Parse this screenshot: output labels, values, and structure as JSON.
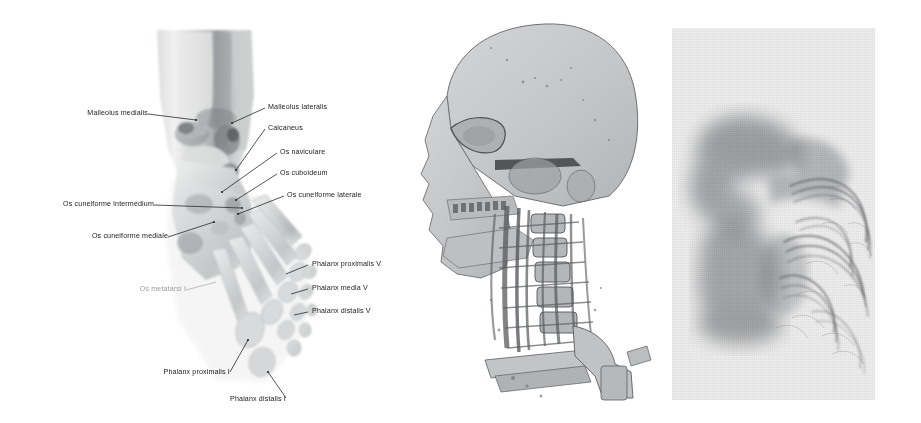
{
  "figure": {
    "caption_visible": false,
    "background_color": "#ffffff",
    "panel_count": 3
  },
  "panels": {
    "foot": {
      "name": "Annotated CT volume rendering of foot and ankle",
      "modality": "ct-volume-rendering",
      "view": "dorsal oblique",
      "render_color": "#b9bcbe",
      "label_color": "#1a1a1a",
      "faint_label_color": "#9a9a9a",
      "labels": [
        {
          "id": "malleolus-medialis",
          "text": "Malleolus medialis",
          "side": "left",
          "x": 58,
          "y": 116,
          "lead_to_x": 162,
          "lead_to_y": 122,
          "faint": false
        },
        {
          "id": "malleolus-lateralis",
          "text": "Malleolus lateralis",
          "side": "right",
          "x": 268,
          "y": 110,
          "lead_to_x": 233,
          "lead_to_y": 123,
          "faint": false
        },
        {
          "id": "calcaneus",
          "text": "Calcaneus",
          "side": "right",
          "x": 268,
          "y": 131,
          "lead_to_x": 238,
          "lead_to_y": 172,
          "faint": false
        },
        {
          "id": "os-naviculare",
          "text": "Os naviculare",
          "side": "right",
          "x": 280,
          "y": 155,
          "lead_to_x": 222,
          "lead_to_y": 192,
          "faint": false
        },
        {
          "id": "os-cuboideum",
          "text": "Os cuboideum",
          "side": "right",
          "x": 280,
          "y": 176,
          "lead_to_x": 235,
          "lead_to_y": 201,
          "faint": false
        },
        {
          "id": "os-cuneiforme-laterale",
          "text": "Os cuneiforme laterale",
          "side": "right",
          "x": 287,
          "y": 198,
          "lead_to_x": 237,
          "lead_to_y": 214,
          "faint": false
        },
        {
          "id": "os-cuneiforme-intermedium",
          "text": "Os cuneiforme intermedium",
          "side": "left",
          "x": 62,
          "y": 207,
          "lead_to_x": 235,
          "lead_to_y": 209,
          "faint": false
        },
        {
          "id": "os-cuneiforme-mediale",
          "text": "Os cuneiforme mediale",
          "side": "left",
          "x": 65,
          "y": 239,
          "lead_to_x": 213,
          "lead_to_y": 223,
          "faint": false
        },
        {
          "id": "os-metatarsi-i",
          "text": "Os metatarsi I",
          "side": "left",
          "x": 120,
          "y": 292,
          "lead_to_x": 208,
          "lead_to_y": 281,
          "faint": true
        },
        {
          "id": "phalanx-proximalis-v",
          "text": "Phalanx proximalis V",
          "side": "right",
          "x": 312,
          "y": 267,
          "lead_to_x": 291,
          "lead_to_y": 275,
          "faint": false
        },
        {
          "id": "phalanx-media-v",
          "text": "Phalanx media V",
          "side": "right",
          "x": 312,
          "y": 291,
          "lead_to_x": 293,
          "lead_to_y": 295,
          "faint": false
        },
        {
          "id": "phalanx-distalis-v",
          "text": "Phalanx distalis V",
          "side": "right",
          "x": 312,
          "y": 314,
          "lead_to_x": 296,
          "lead_to_y": 316,
          "faint": false
        },
        {
          "id": "phalanx-proximalis-i",
          "text": "Phalanx proximalis I",
          "side": "left",
          "x": 133,
          "y": 375,
          "lead_to_x": 229,
          "lead_to_y": 350,
          "faint": false
        },
        {
          "id": "phalanx-distalis-i",
          "text": "Phalanx distalis I",
          "side": "left",
          "x": 238,
          "y": 404,
          "lead_to_x": 253,
          "lead_to_y": 377,
          "faint": false
        }
      ]
    },
    "head": {
      "name": "CT angiography volume rendering of head, neck vessels and cervical spine",
      "modality": "ct-angiography-volume-rendering",
      "view": "lateral oblique",
      "skull_fill": "#c9cbcc",
      "vessel_color": "#55585c",
      "labels": []
    },
    "flow": {
      "name": "Grayscale flow and interference pattern visualization",
      "modality": "grayscale-texture",
      "background_color": "#f0f0f0",
      "blur_blob_color": "#8a8d90",
      "ridge_color": "#5c5f63",
      "labels": []
    }
  }
}
